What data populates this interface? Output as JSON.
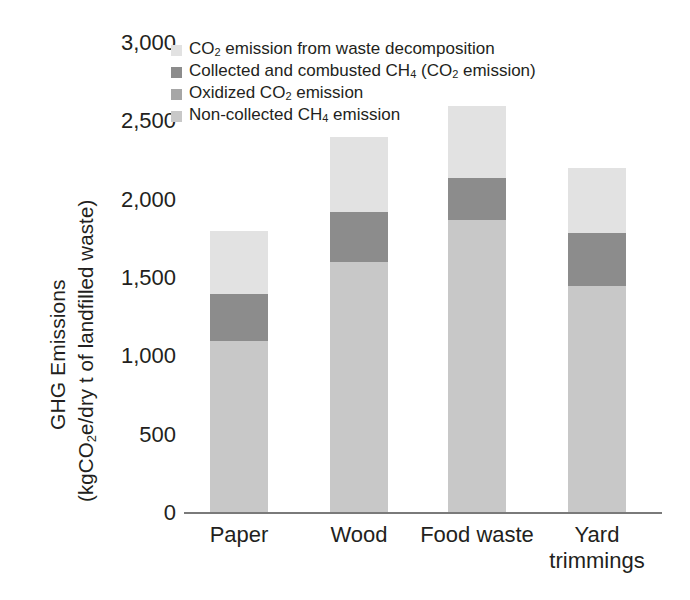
{
  "chart_data": {
    "type": "bar",
    "stacked": true,
    "title": "",
    "xlabel": "",
    "ylabel": "GHG Emissions (kgCO2e/dry t of landfilled waste)",
    "categories": [
      "Paper",
      "Wood",
      "Food waste",
      "Yard trimmings"
    ],
    "ylim": [
      0,
      3000
    ],
    "yticks": [
      0,
      500,
      1000,
      1500,
      2000,
      2500,
      3000
    ],
    "ytick_labels": [
      "0",
      "500",
      "1,000",
      "1,500",
      "2,000",
      "2,500",
      "3,000"
    ],
    "grid": false,
    "legend_position": "top-left-inside",
    "series": [
      {
        "name": "Non-collected CH4 emission",
        "color": "#c8c8c8",
        "values": [
          1100,
          1600,
          1870,
          1450
        ]
      },
      {
        "name": "Oxidized CO2 emission",
        "color": "#a6a6a6",
        "values": [
          0,
          0,
          0,
          0
        ]
      },
      {
        "name": "Collected and combusted CH4 (CO2 emission)",
        "color": "#8c8c8c",
        "values": [
          300,
          320,
          270,
          340
        ]
      },
      {
        "name": "CO2 emission from waste decomposition",
        "color": "#e2e2e2",
        "values": [
          400,
          480,
          460,
          410
        ]
      }
    ],
    "totals": [
      1800,
      2400,
      2600,
      2200
    ]
  },
  "axis": {
    "y_title_line1": "GHG Emissions",
    "y_title_line2_pre": "(kgCO",
    "y_title_line2_sub": "2",
    "y_title_line2_post": "e/dry t of landfilled waste)"
  },
  "legend": {
    "items": [
      {
        "key": "co2-decomposition",
        "color": "#e2e2e2",
        "pre": "CO",
        "sub": "2",
        "post": " emission from waste decomposition",
        "full": "CO2 emission from waste decomposition"
      },
      {
        "key": "collected-combusted-ch4",
        "color": "#8c8c8c",
        "pre": "Collected and combusted CH",
        "sub": "4",
        "post": " (CO",
        "sub2": "2",
        "post2": " emission)",
        "full": "Collected and combusted CH4 (CO2 emission)"
      },
      {
        "key": "oxidized-co2",
        "color": "#a6a6a6",
        "pre": "Oxidized CO",
        "sub": "2",
        "post": " emission",
        "full": "Oxidized CO2 emission"
      },
      {
        "key": "non-collected-ch4",
        "color": "#c8c8c8",
        "pre": "Non-collected CH",
        "sub": "4",
        "post": " emission",
        "full": "Non-collected CH4 emission"
      }
    ]
  },
  "xlabels": [
    {
      "line1": "Paper",
      "line2": ""
    },
    {
      "line1": "Wood",
      "line2": ""
    },
    {
      "line1": "Food waste",
      "line2": ""
    },
    {
      "line1": "Yard",
      "line2": "trimmings"
    }
  ]
}
